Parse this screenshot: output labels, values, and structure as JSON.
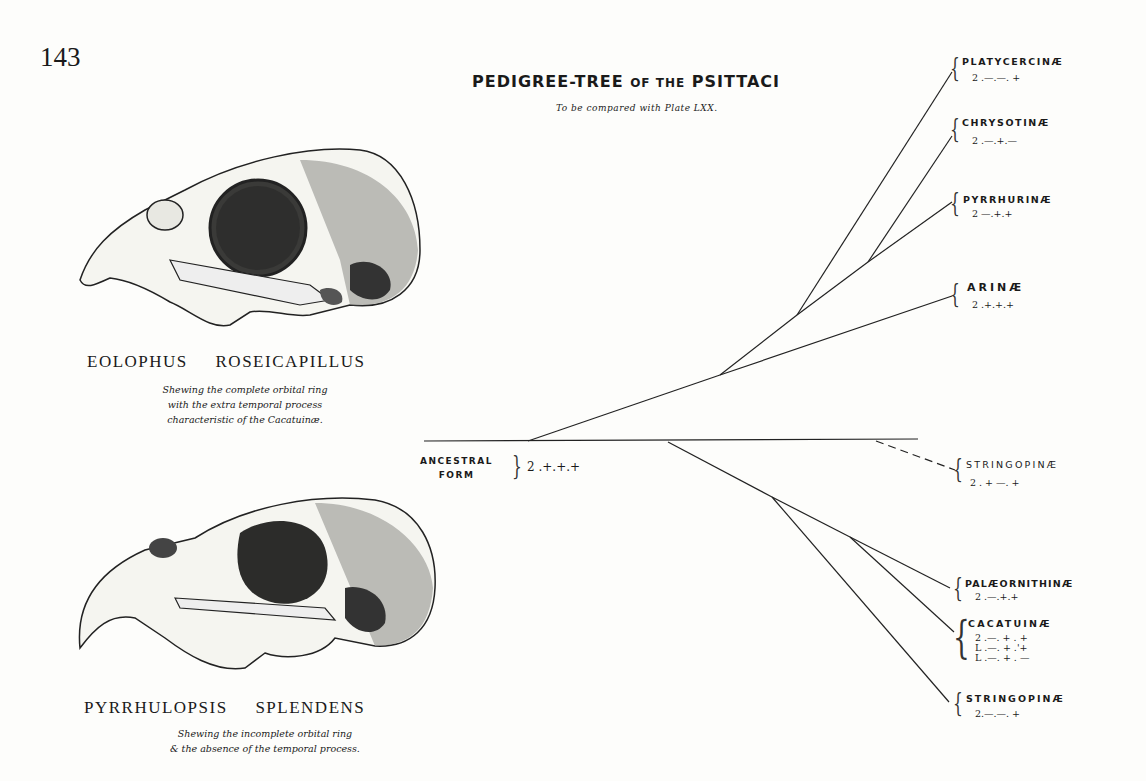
{
  "page_number": "143",
  "title": {
    "main": "PEDIGREE-TREE",
    "of_the": "OF THE",
    "group": "PSITTACI",
    "subtitle": "To be compared with Plate LXX."
  },
  "figures": [
    {
      "species": "EOLOPHUS ROSEICAPILLUS",
      "caption": [
        "Shewing the complete orbital ring",
        "with the extra temporal process",
        "characteristic of the Cacatuinæ."
      ]
    },
    {
      "species": "PYRRHULOPSIS SPLENDENS",
      "caption": [
        "Shewing the incomplete orbital ring",
        "& the absence of the temporal process."
      ]
    }
  ],
  "root": {
    "label_line1": "ANCESTRAL",
    "label_line2": "FORM",
    "formula": "2 .+.+.+"
  },
  "clades": [
    {
      "name": "PLATYCERCINÆ",
      "formulas": [
        "2 .—.—. +"
      ],
      "dashed": false
    },
    {
      "name": "CHRYSOTINÆ",
      "formulas": [
        "2 .—.+.—"
      ],
      "dashed": false
    },
    {
      "name": "PYRRHURINÆ",
      "formulas": [
        "2 —.+.+"
      ],
      "dashed": false
    },
    {
      "name": "ARINÆ",
      "formulas": [
        "2 .+.+.+"
      ],
      "dashed": false
    },
    {
      "name": "STRINGOPINÆ",
      "formulas": [
        "2 . + —. +"
      ],
      "dashed": true
    },
    {
      "name": "PALÆORNITHINÆ",
      "formulas": [
        "2 .—.+.+"
      ],
      "dashed": false
    },
    {
      "name": "CACATUINÆ",
      "formulas": [
        "2 .—. + . +",
        "L .—. + .'+",
        "L .—. + . —"
      ],
      "dashed": false
    },
    {
      "name": "STRINGOPINÆ",
      "formulas": [
        "2.—.—. +"
      ],
      "dashed": false
    }
  ]
}
